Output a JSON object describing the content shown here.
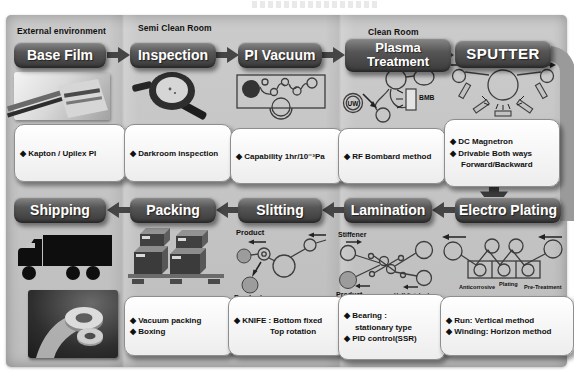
{
  "zones": {
    "external": "External environment",
    "semi_clean": "Semi Clean Room",
    "clean": "Clean Room"
  },
  "steps": {
    "base_film": {
      "title": "Base Film",
      "note1": "◆ Kapton / Upilex PI"
    },
    "inspection": {
      "title": "Inspection",
      "note1": "◆ Darkroom inspection"
    },
    "pi_vacuum": {
      "title": "PI Vacuum",
      "note1": "◆ Capability 1hr/10⁻³Pa"
    },
    "plasma": {
      "title": "Plasma Treatment",
      "note1": "◆ RF Bombard method",
      "uw_label": "UW",
      "bmb_label": "BMB"
    },
    "sputter": {
      "title": "SPUTTER",
      "note1": "◆ DC Magnetron",
      "note2": "◆ Drivable Both ways",
      "note3": "Forward/Backward"
    },
    "electro_plating": {
      "title": "Electro Plating",
      "note1": "◆ Run: Vertical method",
      "note2": "◆ Winding: Horizon method",
      "tank_left": "Anticorrosive",
      "tank_mid": "Plating",
      "tank_right": "Pre-Treatment"
    },
    "lamination": {
      "title": "Lamination",
      "note1": "◆ Bearing :",
      "note2": "stationary type",
      "note3": "◆ PID control(SSR)",
      "stiffener_label": "Stiffener",
      "product_label": "Product",
      "half_finished_label": "Half-finished"
    },
    "slitting": {
      "title": "Slitting",
      "note1": "◆ KNIFE : Bottom fixed",
      "note2": "Top rotation",
      "product_top_label": "Product",
      "product_bottom_label": "Product"
    },
    "packing": {
      "title": "Packing",
      "note1": "◆ Vacuum packing",
      "note2": "◆ Boxing"
    },
    "shipping": {
      "title": "Shipping"
    }
  },
  "colors": {
    "panel": "#c5c5c5",
    "button_dark": "#3a3a3a",
    "arrow": "#454545",
    "band": "#9a9a9a",
    "note_box": "#ffffff"
  }
}
